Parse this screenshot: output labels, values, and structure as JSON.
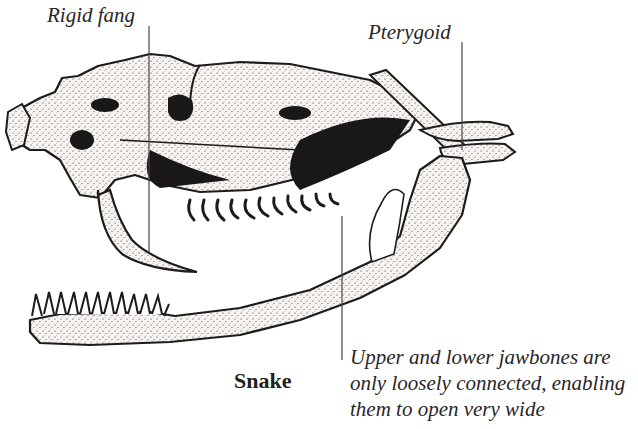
{
  "diagram": {
    "title": "Snake",
    "labels": {
      "rigid_fang": "Rigid fang",
      "pterygoid": "Pterygoid"
    },
    "caption": {
      "line1": "Upper and lower jawbones are",
      "line2": "only loosely connected, enabling",
      "line3": "them to open very wide"
    },
    "colors": {
      "ink": "#231f20",
      "bone": "#f4f1ee",
      "background": "#ffffff"
    }
  }
}
